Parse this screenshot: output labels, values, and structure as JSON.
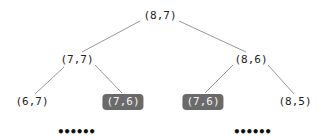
{
  "tree": {
    "nodes": [
      {
        "id": "root",
        "label": "(8,7)",
        "x": 160,
        "y": 16,
        "highlight": false
      },
      {
        "id": "l",
        "label": "(7,7)",
        "x": 77,
        "y": 60,
        "highlight": false
      },
      {
        "id": "r",
        "label": "(8,6)",
        "x": 251,
        "y": 60,
        "highlight": false
      },
      {
        "id": "ll",
        "label": "(6,7)",
        "x": 32,
        "y": 102,
        "highlight": false
      },
      {
        "id": "lr",
        "label": "(7,6)",
        "x": 123,
        "y": 102,
        "highlight": true
      },
      {
        "id": "rl",
        "label": "(7,6)",
        "x": 203,
        "y": 102,
        "highlight": true
      },
      {
        "id": "rr",
        "label": "(8,5)",
        "x": 295,
        "y": 102,
        "highlight": false
      }
    ],
    "edges": [
      [
        "root",
        "l"
      ],
      [
        "root",
        "r"
      ],
      [
        "l",
        "ll"
      ],
      [
        "l",
        "lr"
      ],
      [
        "r",
        "rl"
      ],
      [
        "r",
        "rr"
      ]
    ],
    "ellipses": [
      {
        "label": "••••••",
        "x": 76,
        "y": 132
      },
      {
        "label": "••••••",
        "x": 252,
        "y": 132
      }
    ],
    "colors": {
      "edge": "#999999",
      "highlight_bg": "#6a6a6a",
      "highlight_text": "#f2f2f2"
    }
  }
}
